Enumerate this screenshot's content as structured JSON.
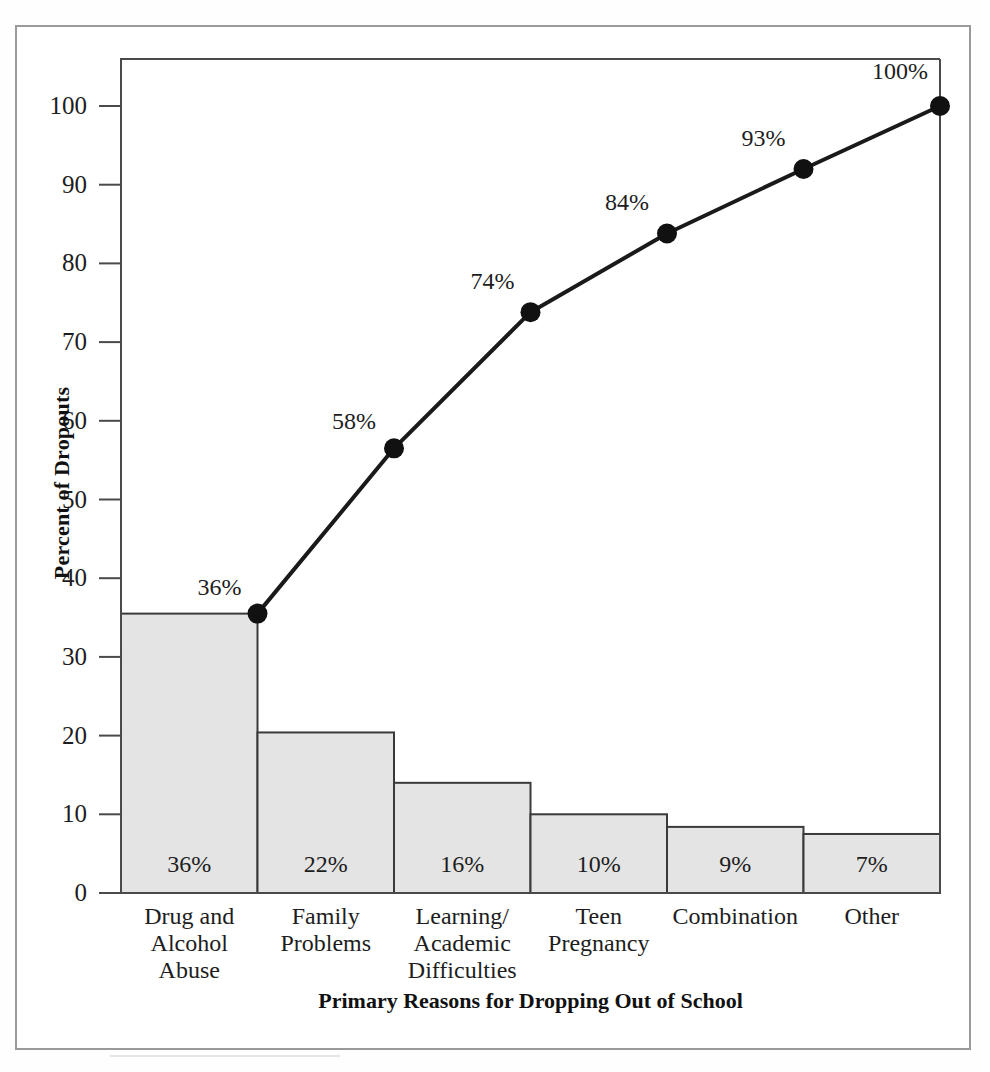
{
  "chart_data": {
    "type": "bar",
    "chart_kind": "pareto",
    "title": "",
    "xlabel": "Primary Reasons for Dropping Out of School",
    "ylabel": "Percent of Dropouts",
    "ylim": [
      0,
      105
    ],
    "ytick_values": [
      0,
      10,
      20,
      30,
      40,
      50,
      60,
      70,
      80,
      90,
      100
    ],
    "ytick_labels": [
      "0",
      "10",
      "20",
      "30",
      "40",
      "50",
      "60",
      "70",
      "80",
      "90",
      "100"
    ],
    "grid": false,
    "legend": false,
    "categories": [
      "Drug and Alcohol Abuse",
      "Family Problems",
      "Learning/ Academic Difficulties",
      "Teen Pregnancy",
      "Combination",
      "Other"
    ],
    "category_lines": [
      [
        "Drug and",
        "Alcohol",
        "Abuse"
      ],
      [
        "Family",
        "Problems"
      ],
      [
        "Learning/",
        "Academic",
        "Difficulties"
      ],
      [
        "Teen",
        "Pregnancy"
      ],
      [
        "Combination"
      ],
      [
        "Other"
      ]
    ],
    "values": [
      35.5,
      20.4,
      14.0,
      10.0,
      8.4,
      7.5
    ],
    "bar_labels": [
      "36%",
      "22%",
      "16%",
      "10%",
      "9%",
      "7%"
    ],
    "series": [
      {
        "name": "Percent of Dropouts",
        "type": "bar",
        "values": [
          35.5,
          20.4,
          14.0,
          10.0,
          8.4,
          7.5
        ]
      },
      {
        "name": "Cumulative Percent",
        "type": "line",
        "values": [
          35.5,
          56.5,
          73.8,
          83.8,
          92.0,
          100.0
        ],
        "point_labels": [
          "36%",
          "58%",
          "74%",
          "84%",
          "93%",
          "100%"
        ]
      }
    ],
    "colors": {
      "bar_fill": "#e4e4e4",
      "bar_stroke": "#3a3a3a",
      "line": "#1a1a1a",
      "marker": "#111111",
      "axis": "#4a4a4a",
      "text": "#1d1d1d",
      "page_border": "#9a9a9a"
    }
  }
}
